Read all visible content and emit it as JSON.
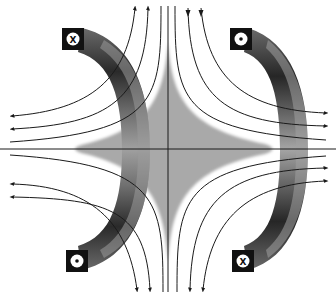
{
  "diagram": {
    "colors": {
      "background": "#ffffff",
      "field_line": "#1a1a1a",
      "central_region": "#a9a9a9",
      "pole_dark": "#1e1e1e",
      "pole_mid": "#5a5a5a",
      "pole_light": "#9a9a9a",
      "marker_box": "#111111",
      "marker_circle": "#ffffff"
    },
    "poles": [
      {
        "id": "left-pole",
        "side": "left"
      },
      {
        "id": "right-pole",
        "side": "right"
      }
    ],
    "current_markers": [
      {
        "id": "top-left",
        "symbol": "x",
        "meaning": "current into page"
      },
      {
        "id": "top-right",
        "symbol": "dot",
        "meaning": "current out of page"
      },
      {
        "id": "bottom-left",
        "symbol": "dot",
        "meaning": "current out of page"
      },
      {
        "id": "bottom-right",
        "symbol": "x",
        "meaning": "current into page"
      }
    ],
    "marker_glyphs": {
      "x": "X",
      "dot": "•"
    },
    "field_lines": {
      "top_left_arrows": "up",
      "top_right_arrows": "down",
      "bottom_arrows": "up",
      "left_arrows": "left",
      "right_arrows": "right"
    },
    "axes": {
      "horizontal": true,
      "vertical": true
    }
  }
}
